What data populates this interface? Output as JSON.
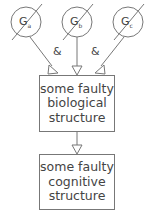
{
  "genes": [
    {
      "letter": "G",
      "sub": "a"
    },
    {
      "letter": "G",
      "sub": "b"
    },
    {
      "letter": "G",
      "sub": "c"
    }
  ],
  "connectors": [
    "&",
    "&"
  ],
  "boxes": [
    {
      "lines": [
        "some faulty",
        "biological",
        "structure"
      ]
    },
    {
      "lines": [
        "some faulty",
        "cognitive",
        "structure"
      ]
    }
  ],
  "colors": {
    "stroke": "#777777",
    "text": "#444444"
  }
}
